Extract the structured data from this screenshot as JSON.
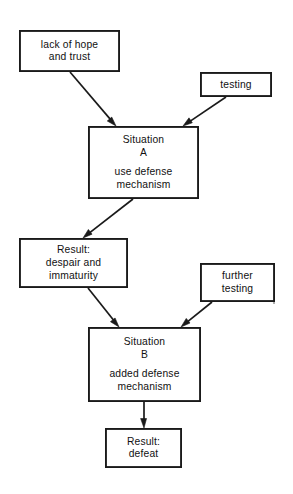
{
  "diagram": {
    "background_color": "#ffffff",
    "line_color": "#1a1a1a",
    "text_color": "#111111",
    "nodes": [
      {
        "id": "lack-of-hope",
        "name": "node-lack-of-hope-and-trust",
        "lines": [
          "lack of hope",
          "and trust"
        ],
        "x": 19,
        "y": 30,
        "w": 101,
        "h": 42
      },
      {
        "id": "testing",
        "name": "node-testing",
        "lines": [
          "testing"
        ],
        "x": 200,
        "y": 72,
        "w": 72,
        "h": 25
      },
      {
        "id": "situation-a",
        "name": "node-situation-a",
        "lines": [
          "Situation",
          "A",
          "",
          "use defense",
          "mechanism"
        ],
        "x": 88,
        "y": 126,
        "w": 111,
        "h": 73
      },
      {
        "id": "result-despair",
        "name": "node-result-despair-and-immaturity",
        "lines": [
          "Result:",
          "despair and",
          "immaturity"
        ],
        "x": 19,
        "y": 238,
        "w": 109,
        "h": 50
      },
      {
        "id": "further-testing",
        "name": "node-further-testing",
        "lines": [
          "further",
          "testing"
        ],
        "x": 200,
        "y": 263,
        "w": 75,
        "h": 39
      },
      {
        "id": "situation-b",
        "name": "node-situation-b",
        "lines": [
          "Situation",
          "B",
          "",
          "added defense",
          "mechanism"
        ],
        "x": 88,
        "y": 327,
        "w": 113,
        "h": 75
      },
      {
        "id": "result-defeat",
        "name": "node-result-defeat",
        "lines": [
          "Result:",
          "defeat"
        ],
        "x": 105,
        "y": 428,
        "w": 77,
        "h": 40
      }
    ],
    "edges": [
      {
        "id": "e1",
        "name": "arrow-lack-of-hope-to-situation-a",
        "from": "lack-of-hope",
        "to": "situation-a",
        "x1": 70,
        "y1": 72,
        "x2": 116,
        "y2": 126
      },
      {
        "id": "e2",
        "name": "arrow-testing-to-situation-a",
        "from": "testing",
        "to": "situation-a",
        "x1": 226,
        "y1": 97,
        "x2": 183,
        "y2": 126
      },
      {
        "id": "e3",
        "name": "arrow-situation-a-to-result-despair",
        "from": "situation-a",
        "to": "result-despair",
        "x1": 133,
        "y1": 199,
        "x2": 83,
        "y2": 238
      },
      {
        "id": "e4",
        "name": "arrow-result-despair-to-situation-b",
        "from": "result-despair",
        "to": "situation-b",
        "x1": 88,
        "y1": 288,
        "x2": 119,
        "y2": 327
      },
      {
        "id": "e5",
        "name": "arrow-further-testing-to-situation-b",
        "from": "further-testing",
        "to": "situation-b",
        "x1": 212,
        "y1": 302,
        "x2": 181,
        "y2": 327
      },
      {
        "id": "e6",
        "name": "arrow-situation-b-to-result-defeat",
        "from": "situation-b",
        "to": "result-defeat",
        "x1": 144,
        "y1": 402,
        "x2": 144,
        "y2": 428
      }
    ],
    "artifacts": [
      {
        "name": "scan-speck",
        "x": 274,
        "y": 303,
        "r": 1.1
      }
    ]
  }
}
